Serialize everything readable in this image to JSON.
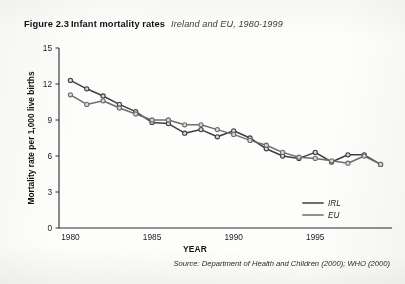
{
  "figure": {
    "number": "Figure 2.3",
    "title": "Infant mortality rates",
    "subtitle": "Ireland and EU, 1980-1999",
    "source": "Source: Department of Health and Children (2000); WHO (2000)"
  },
  "legend": {
    "position": "bottom-right",
    "entries": [
      {
        "label": "IRL",
        "color": "#3f3f3f"
      },
      {
        "label": "EU",
        "color": "#6e6e6e"
      }
    ]
  },
  "axis": {
    "x_title": "YEAR",
    "y_title": "Mortality rate per 1,000 live births",
    "x_ticks": [
      "1980",
      "1985",
      "1990",
      "1995"
    ],
    "y_ticks": [
      "0",
      "3",
      "6",
      "9",
      "12",
      "15"
    ]
  },
  "chart_data": {
    "type": "line",
    "title": "Infant mortality rates",
    "subtitle": "Ireland and EU, 1980-1999",
    "xlabel": "YEAR",
    "ylabel": "Mortality rate per 1,000 live births",
    "xlim": [
      1979.3,
      1999.7
    ],
    "ylim": [
      0,
      15
    ],
    "xticks": [
      1980,
      1985,
      1990,
      1995
    ],
    "yticks": [
      0,
      3,
      6,
      9,
      12,
      15
    ],
    "grid": false,
    "legend_position": "lower right",
    "markers": "circle",
    "x": [
      1980,
      1981,
      1982,
      1983,
      1984,
      1985,
      1986,
      1987,
      1988,
      1989,
      1990,
      1991,
      1992,
      1993,
      1994,
      1995,
      1996,
      1997,
      1998,
      1999
    ],
    "series": [
      {
        "name": "IRL",
        "color": "#3f3f3f",
        "values": [
          12.3,
          11.6,
          11.0,
          10.3,
          9.7,
          8.8,
          8.7,
          7.9,
          8.2,
          7.6,
          8.1,
          7.5,
          6.6,
          6.0,
          5.8,
          6.3,
          5.5,
          6.1,
          6.1,
          5.3
        ]
      },
      {
        "name": "EU",
        "color": "#6e6e6e",
        "values": [
          11.1,
          10.3,
          10.6,
          10.0,
          9.5,
          9.0,
          9.0,
          8.6,
          8.6,
          8.2,
          7.8,
          7.3,
          6.9,
          6.3,
          5.9,
          5.8,
          5.6,
          5.4,
          6.0,
          5.3
        ]
      }
    ],
    "source": "Source: Department of Health and Children (2000); WHO (2000)"
  }
}
